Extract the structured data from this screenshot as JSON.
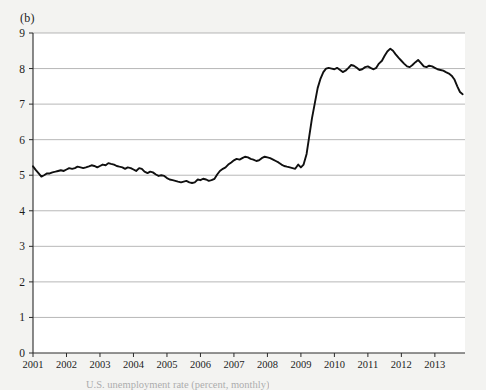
{
  "figure": {
    "panel_label": "(b)",
    "background_color": "#f3f3f1",
    "plot_background_color": "#ffffff",
    "line_color": "#101010",
    "grid_color": "#9a9a9a",
    "cropped_caption": "U.S. unemployment rate (percent, monthly)"
  },
  "chart_data": {
    "type": "line",
    "title": "(b)",
    "xlabel": "",
    "ylabel": "",
    "xlim": [
      2001.0,
      2013.9
    ],
    "ylim": [
      0,
      9
    ],
    "grid": true,
    "legend": null,
    "yticks": [
      0,
      1,
      2,
      3,
      4,
      5,
      6,
      7,
      8,
      9
    ],
    "ytick_labels": [
      "0",
      "1",
      "2",
      "3",
      "4",
      "5",
      "6",
      "7",
      "8",
      "9"
    ],
    "xticks": [
      2001,
      2002,
      2003,
      2004,
      2005,
      2006,
      2007,
      2008,
      2009,
      2010,
      2011,
      2012,
      2013
    ],
    "xtick_labels": [
      "2001",
      "2002",
      "2003",
      "2004",
      "2005",
      "2006",
      "2007",
      "2008",
      "2009",
      "2010",
      "2011",
      "2012",
      "2013"
    ],
    "series": [
      {
        "name": "unemployment-rate",
        "color": "#101010",
        "x": [
          2001.0,
          2001.08,
          2001.17,
          2001.25,
          2001.33,
          2001.42,
          2001.5,
          2001.58,
          2001.67,
          2001.75,
          2001.83,
          2001.92,
          2002.0,
          2002.08,
          2002.17,
          2002.25,
          2002.33,
          2002.42,
          2002.5,
          2002.58,
          2002.67,
          2002.75,
          2002.83,
          2002.92,
          2003.0,
          2003.08,
          2003.17,
          2003.25,
          2003.33,
          2003.42,
          2003.5,
          2003.58,
          2003.67,
          2003.75,
          2003.83,
          2003.92,
          2004.0,
          2004.08,
          2004.17,
          2004.25,
          2004.33,
          2004.42,
          2004.5,
          2004.58,
          2004.67,
          2004.75,
          2004.83,
          2004.92,
          2005.0,
          2005.08,
          2005.17,
          2005.25,
          2005.33,
          2005.42,
          2005.5,
          2005.58,
          2005.67,
          2005.75,
          2005.83,
          2005.92,
          2006.0,
          2006.08,
          2006.17,
          2006.25,
          2006.33,
          2006.42,
          2006.5,
          2006.58,
          2006.67,
          2006.75,
          2006.83,
          2006.92,
          2007.0,
          2007.08,
          2007.17,
          2007.25,
          2007.33,
          2007.42,
          2007.5,
          2007.58,
          2007.67,
          2007.75,
          2007.83,
          2007.92,
          2008.0,
          2008.08,
          2008.17,
          2008.25,
          2008.33,
          2008.42,
          2008.5,
          2008.58,
          2008.67,
          2008.75,
          2008.83,
          2008.92,
          2009.0,
          2009.08,
          2009.17,
          2009.25,
          2009.33,
          2009.42,
          2009.5,
          2009.58,
          2009.67,
          2009.75,
          2009.83,
          2009.92,
          2010.0,
          2010.08,
          2010.17,
          2010.25,
          2010.33,
          2010.42,
          2010.5,
          2010.58,
          2010.67,
          2010.75,
          2010.83,
          2010.92,
          2011.0,
          2011.08,
          2011.17,
          2011.25,
          2011.33,
          2011.42,
          2011.5,
          2011.58,
          2011.67,
          2011.75,
          2011.83,
          2011.92,
          2012.0,
          2012.08,
          2012.17,
          2012.25,
          2012.33,
          2012.42,
          2012.5,
          2012.58,
          2012.67,
          2012.75,
          2012.83,
          2012.92,
          2013.0,
          2013.08,
          2013.17,
          2013.25,
          2013.33,
          2013.42,
          2013.5,
          2013.58,
          2013.67,
          2013.75,
          2013.83
        ],
        "y": [
          5.25,
          5.15,
          5.05,
          4.96,
          5.0,
          5.05,
          5.05,
          5.08,
          5.1,
          5.12,
          5.14,
          5.12,
          5.16,
          5.2,
          5.18,
          5.2,
          5.24,
          5.22,
          5.2,
          5.22,
          5.25,
          5.28,
          5.26,
          5.22,
          5.26,
          5.3,
          5.28,
          5.34,
          5.32,
          5.3,
          5.26,
          5.24,
          5.22,
          5.18,
          5.22,
          5.2,
          5.16,
          5.12,
          5.2,
          5.18,
          5.1,
          5.06,
          5.1,
          5.08,
          5.02,
          4.98,
          5.0,
          4.98,
          4.92,
          4.88,
          4.86,
          4.84,
          4.82,
          4.8,
          4.82,
          4.84,
          4.8,
          4.78,
          4.8,
          4.88,
          4.86,
          4.9,
          4.88,
          4.84,
          4.86,
          4.9,
          5.02,
          5.12,
          5.18,
          5.22,
          5.3,
          5.36,
          5.42,
          5.46,
          5.44,
          5.48,
          5.52,
          5.5,
          5.46,
          5.44,
          5.4,
          5.42,
          5.48,
          5.52,
          5.5,
          5.48,
          5.44,
          5.4,
          5.36,
          5.3,
          5.26,
          5.24,
          5.22,
          5.2,
          5.18,
          5.3,
          5.22,
          5.3,
          5.6,
          6.1,
          6.6,
          7.05,
          7.45,
          7.7,
          7.9,
          8.0,
          8.02,
          8.0,
          7.98,
          8.02,
          7.96,
          7.9,
          7.94,
          8.02,
          8.1,
          8.08,
          8.02,
          7.96,
          7.98,
          8.04,
          8.06,
          8.02,
          7.98,
          8.02,
          8.14,
          8.22,
          8.36,
          8.48,
          8.56,
          8.5,
          8.4,
          8.3,
          8.22,
          8.14,
          8.06,
          8.04,
          8.1,
          8.18,
          8.24,
          8.16,
          8.06,
          8.04,
          8.08,
          8.06,
          8.02,
          7.98,
          7.96,
          7.94,
          7.9,
          7.86,
          7.8,
          7.7,
          7.5,
          7.34,
          7.28
        ]
      }
    ]
  }
}
